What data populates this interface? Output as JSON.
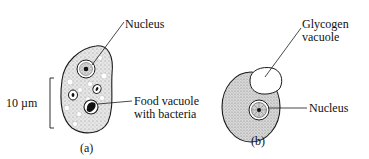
{
  "figure": {
    "panels": [
      {
        "id": "a",
        "caption": "(a)",
        "labels": {
          "nucleus": "Nucleus",
          "food_vacuole_line1": "Food vacuole",
          "food_vacuole_line2": "with bacteria"
        },
        "scale_bar": {
          "label": "10 µm"
        }
      },
      {
        "id": "b",
        "caption": "(b)",
        "labels": {
          "glycogen_line1": "Glycogen",
          "glycogen_line2": "vacuole",
          "nucleus": "Nucleus"
        }
      }
    ],
    "colors": {
      "outline": "#1a1a1a",
      "cytoplasm_stipple": "#bdbdbd",
      "background": "#ffffff"
    }
  }
}
